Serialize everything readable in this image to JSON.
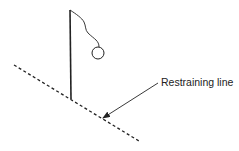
{
  "diagram": {
    "title": "",
    "labels": {
      "restraining_line": "Restraining line"
    },
    "elements": [
      {
        "id": "restraining-line",
        "type": "dashed-line",
        "from": [
          14,
          65
        ],
        "to": [
          139,
          141
        ]
      },
      {
        "id": "pole",
        "type": "line",
        "from": [
          70,
          10
        ],
        "to": [
          71,
          99
        ]
      },
      {
        "id": "string",
        "type": "curve",
        "from": [
          70,
          10
        ],
        "to": [
          99,
          46
        ]
      },
      {
        "id": "ball",
        "type": "circle",
        "center": [
          98,
          53
        ],
        "r": 6
      },
      {
        "id": "label-arrow",
        "type": "arrow",
        "from": [
          158,
          83
        ],
        "to": [
          103,
          118
        ]
      }
    ],
    "colors": {
      "stroke": "#222222",
      "background": "#ffffff"
    }
  }
}
